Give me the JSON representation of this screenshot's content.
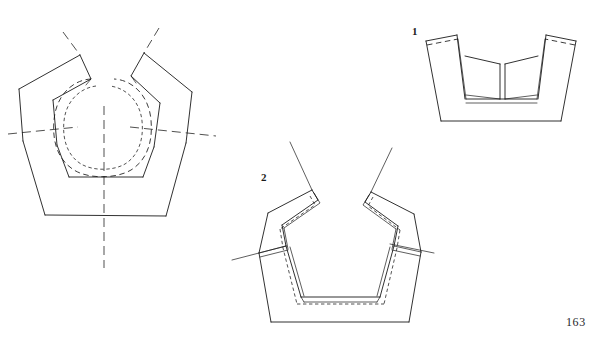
{
  "page": {
    "folio": "163",
    "background_color": "#ffffff",
    "ink_color": "#1a1a1a",
    "width": 604,
    "height": 345,
    "medium": "line drawing plate"
  },
  "figures": [
    {
      "id": "fig-3",
      "number": "",
      "caption": "",
      "view": "plan view with centre lines",
      "position": "left",
      "description": "V-shaped trough blank seen from above with dash-dot centre lines, hidden dashed rounded inner contour and two splayed flange wings"
    },
    {
      "id": "fig-1",
      "number": "1",
      "caption": "1",
      "view": "front elevation",
      "position": "top-right",
      "description": "Shallow trapezoidal vessel with two upright end walls and two inward-sloping inner panels, dashed hidden fold lines along the top rims"
    },
    {
      "id": "fig-2",
      "number": "2",
      "caption": "2",
      "view": "perspective / folded assembly",
      "position": "bottom-centre",
      "description": "Folded V-shaped trough in perspective with doubled rim bands, dashed hidden edges and two outward-folded wings crossed by axis lines"
    }
  ],
  "line_styles": {
    "solid": "visible edge",
    "dashed": "hidden edge",
    "dash_dot": "centre line / axis"
  }
}
